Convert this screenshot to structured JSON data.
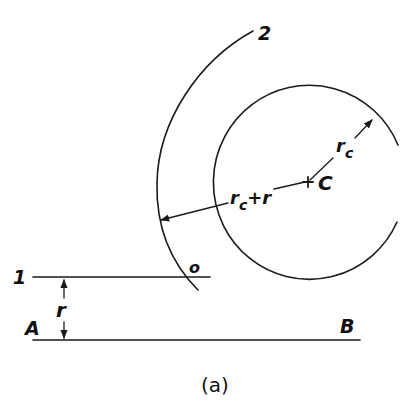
{
  "figure": {
    "caption": "(a)",
    "labels": {
      "arc_label": "2",
      "line1_label": "1",
      "point_o": "o",
      "point_a": "A",
      "point_b": "B",
      "center": "C",
      "dim_r": "r",
      "dim_rc_main": "r",
      "dim_rc_sub": "c",
      "dim_rcr_main": "r",
      "dim_rcr_sub": "c",
      "dim_rcr_rest": "+r"
    }
  },
  "colors": {
    "ink": "#1a1a1a",
    "background": "#ffffff"
  }
}
